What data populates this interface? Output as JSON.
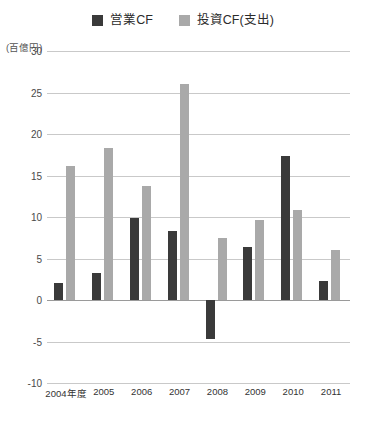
{
  "legend": {
    "items": [
      {
        "label": "営業CF",
        "color": "#3a3a3a",
        "icon": "square-swatch-icon"
      },
      {
        "label": "投資CF(支出)",
        "color": "#a9a9a9",
        "icon": "square-swatch-icon"
      }
    ]
  },
  "axis": {
    "unit_label": "(百億円)"
  },
  "chart_data": {
    "type": "bar",
    "title": "",
    "subtitle": "",
    "xlabel": "",
    "ylabel": "(百億円)",
    "ylim": [
      -10,
      30
    ],
    "yticks": [
      30,
      25,
      20,
      15,
      10,
      5,
      0,
      -5,
      -10
    ],
    "ytick_labels": [
      "30",
      "25",
      "20",
      "15",
      "10",
      "5",
      "0",
      "-5",
      "-10"
    ],
    "grid": true,
    "legend_position": "top-center",
    "categories": [
      "2004年度",
      "2005",
      "2006",
      "2007",
      "2008",
      "2009",
      "2010",
      "2011"
    ],
    "series": [
      {
        "name": "営業CF",
        "color": "#3a3a3a",
        "values": [
          2.0,
          3.2,
          9.9,
          8.3,
          -4.7,
          6.4,
          17.3,
          2.3
        ]
      },
      {
        "name": "投資CF(支出)",
        "color": "#a9a9a9",
        "values": [
          16.1,
          18.3,
          13.7,
          26.0,
          7.5,
          9.6,
          10.9,
          6.0
        ]
      }
    ]
  }
}
